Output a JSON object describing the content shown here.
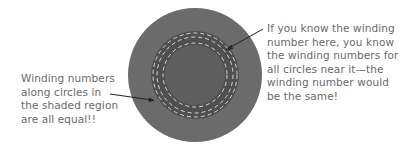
{
  "annotations": {
    "left": {
      "lines": [
        "Winding numbers",
        "along circles in",
        "the shaded region",
        "are all equal!!"
      ]
    },
    "right": {
      "lines": [
        "If you know the winding",
        "number here, you know",
        "the winding numbers for",
        "all circles near it—the",
        "winding number would",
        "be the same!"
      ]
    }
  },
  "colors": {
    "outer_disk": "#6b6b6b",
    "shaded_annulus": "#4f4f4f",
    "inner_disk": "#5e5e5e",
    "dashed_circle": "#d9d9d9",
    "arrow": "#222222",
    "text": "#6a6a6a"
  }
}
